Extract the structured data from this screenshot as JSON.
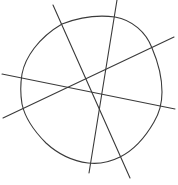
{
  "figure": {
    "stroke_color": "#3a3a3a",
    "background_color": "#ffffff",
    "shapes": {
      "closed_curve": {
        "label": "closed-curve"
      },
      "lines": [
        {
          "id": "line-a",
          "label": "steep line descending right"
        },
        {
          "id": "line-b",
          "label": "near-vertical line"
        },
        {
          "id": "line-c",
          "label": "shallow line descending right"
        },
        {
          "id": "line-d",
          "label": "line rising right"
        }
      ]
    }
  }
}
